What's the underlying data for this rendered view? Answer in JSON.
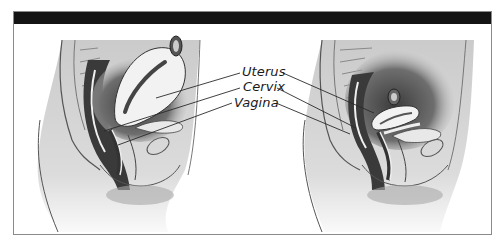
{
  "figure": {
    "title_bar": "",
    "colors": {
      "title_bar": "#141414",
      "border": "#8a8a8a",
      "tissue_dark": "#4a4a4a",
      "tissue_mid": "#8c8c8c",
      "tissue_light": "#d6d6d6",
      "organ_fill": "#f2f2f2",
      "line": "#2a2a2a"
    },
    "panels": [
      {
        "name": "left-panel",
        "description": "sagittal pelvis view, uterus anteverted"
      },
      {
        "name": "right-panel",
        "description": "sagittal pelvis view, uterus retroverted / smaller"
      }
    ],
    "labels": [
      {
        "text": "Uterus"
      },
      {
        "text": "Cervix"
      },
      {
        "text": "Vagina"
      }
    ]
  }
}
